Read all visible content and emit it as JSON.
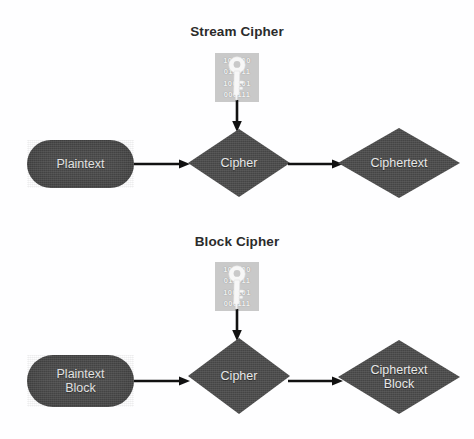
{
  "diagram": {
    "title_stream": "Stream Cipher",
    "title_block": "Block Cipher",
    "background_color": "#ffffff",
    "shape_fill_color": "#4b4b4b",
    "shape_text_color": "#e8e8e8",
    "title_text_color": "#2b2b2b",
    "arrow_color": "#111111",
    "key_panel_color": "#c9c9c9",
    "key_glyph_color": "#f5f5f5"
  },
  "stream_row": {
    "plaintext": "Plaintext",
    "cipher": "Cipher",
    "ciphertext": "Ciphertext",
    "key_icon": "key-icon",
    "key_bits": [
      "100100",
      "011011",
      "100101",
      "000111"
    ],
    "arrow_plaintext_to_cipher": "arrow-right",
    "arrow_cipher_to_ciphertext": "arrow-right",
    "arrow_key_to_cipher": "arrow-down"
  },
  "block_row": {
    "plaintext": "Plaintext\nBlock",
    "cipher": "Cipher",
    "ciphertext": "Ciphertext\nBlock",
    "key_icon": "key-icon",
    "key_bits": [
      "100100",
      "011011",
      "100101",
      "000111"
    ],
    "arrow_plaintext_to_cipher": "arrow-right",
    "arrow_cipher_to_ciphertext": "arrow-right",
    "arrow_key_to_cipher": "arrow-down"
  }
}
